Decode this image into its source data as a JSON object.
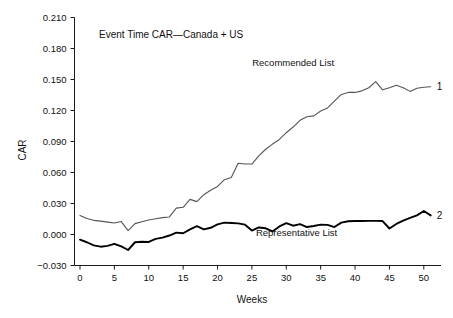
{
  "chart_data": {
    "type": "line",
    "title": "Event Time CAR—Canada + US",
    "xlabel": "Weeks",
    "ylabel": "CAR",
    "xlim": [
      -0.8,
      52.5
    ],
    "ylim": [
      -0.03,
      0.21
    ],
    "xticks": [
      0,
      5,
      10,
      15,
      20,
      25,
      30,
      35,
      40,
      45,
      50
    ],
    "xticklabels": [
      "0",
      "5",
      "10",
      "15",
      "20",
      "25",
      "30",
      "35",
      "40",
      "45",
      "50"
    ],
    "yticks": [
      -0.03,
      0.0,
      0.03,
      0.06,
      0.09,
      0.12,
      0.15,
      0.18,
      0.21
    ],
    "yticklabels": [
      "−0.030",
      "0.000",
      "0.030",
      "0.060",
      "0.090",
      "0.120",
      "0.150",
      "0.180",
      "0.210"
    ],
    "grid": false,
    "legend_position": "inline-annotations",
    "x": [
      0,
      1,
      2,
      3,
      4,
      5,
      6,
      7,
      8,
      9,
      10,
      11,
      12,
      13,
      14,
      15,
      16,
      17,
      18,
      19,
      20,
      21,
      22,
      23,
      24,
      25,
      26,
      27,
      28,
      29,
      30,
      31,
      32,
      33,
      34,
      35,
      36,
      37,
      38,
      39,
      40,
      41,
      42,
      43,
      44,
      45,
      46,
      47,
      48,
      49,
      50,
      51
    ],
    "series": [
      {
        "name": "Recommended List",
        "end_marker": "1",
        "color": "#555555",
        "label_x": 31.0,
        "label_y": 0.163,
        "values": [
          0.0185,
          0.0155,
          0.0137,
          0.0129,
          0.012,
          0.0112,
          0.0125,
          0.0038,
          0.0105,
          0.0123,
          0.0141,
          0.0152,
          0.0163,
          0.017,
          0.0255,
          0.0263,
          0.034,
          0.0318,
          0.0385,
          0.0428,
          0.0465,
          0.053,
          0.0552,
          0.069,
          0.0682,
          0.0682,
          0.076,
          0.0825,
          0.0875,
          0.092,
          0.0985,
          0.104,
          0.1105,
          0.114,
          0.1148,
          0.1195,
          0.1225,
          0.129,
          0.1355,
          0.1375,
          0.1375,
          0.139,
          0.142,
          0.148,
          0.14,
          0.142,
          0.1445,
          0.142,
          0.1385,
          0.1415,
          0.1425,
          0.143
        ]
      },
      {
        "name": "Representative List",
        "end_marker": "2",
        "color": "#000000",
        "label_x": 31.5,
        "label_y": -0.0015,
        "values": [
          -0.005,
          -0.0075,
          -0.0105,
          -0.0118,
          -0.011,
          -0.009,
          -0.0115,
          -0.015,
          -0.0075,
          -0.007,
          -0.0072,
          -0.0043,
          -0.003,
          -0.001,
          0.0018,
          0.0012,
          0.005,
          0.008,
          0.005,
          0.0065,
          0.0098,
          0.0115,
          0.0112,
          0.0108,
          0.0095,
          0.0038,
          0.0068,
          0.006,
          0.003,
          0.0078,
          0.011,
          0.0085,
          0.01,
          0.0072,
          0.0082,
          0.0095,
          0.0093,
          0.0072,
          0.0115,
          0.0128,
          0.013,
          0.013,
          0.0132,
          0.0132,
          0.013,
          0.0058,
          0.0102,
          0.0135,
          0.016,
          0.0185,
          0.0228,
          0.0185
        ]
      }
    ]
  },
  "labels": {
    "title": "Event Time CAR—Canada + US",
    "xlabel": "Weeks",
    "ylabel": "CAR"
  }
}
